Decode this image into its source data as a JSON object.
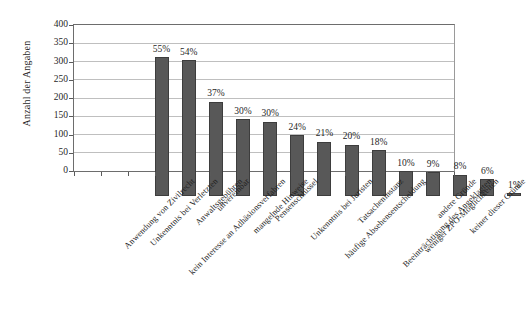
{
  "chart_data": {
    "type": "bar",
    "title": "",
    "xlabel": "",
    "ylabel": "Anzahl der Angaben",
    "ylim": [
      0,
      400
    ],
    "ytick_step": 50,
    "yticks": [
      400,
      350,
      300,
      250,
      200,
      150,
      100,
      50,
      0
    ],
    "grid": true,
    "legend": null,
    "bar_color": "#585858",
    "categories": [
      "Anwendung von Zivilrecht",
      "Unkenntnis bei Verletzten",
      "kein Interesse an Adhäsionsverfahren",
      "Anwaltsgebühren",
      "unvereinbar",
      "mangelnde Hinweise",
      "Pensenschlüssel",
      "Unkenntnis bei Juristen",
      "häufige Absehensentscheidung",
      "Tatsacheninstanz",
      "Beeinträchtigung des Angeklagten",
      "weniger ZPO-Möglichkeiten",
      "andere Gründe",
      "keiner dieser Gründe"
    ],
    "values": [
      380,
      372,
      258,
      210,
      204,
      167,
      148,
      141,
      125,
      68,
      65,
      58,
      46,
      8
    ],
    "data_labels": [
      "55%",
      "54%",
      "37%",
      "30%",
      "30%",
      "24%",
      "21%",
      "20%",
      "18%",
      "10%",
      "9%",
      "8%",
      "6%",
      "1%"
    ]
  },
  "source_note": ""
}
